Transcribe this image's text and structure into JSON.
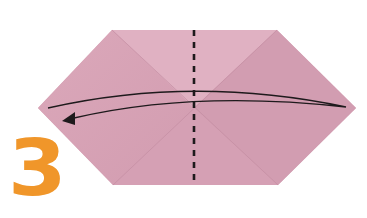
{
  "diagram": {
    "type": "origami-instruction-step",
    "step_number": "3",
    "colors": {
      "paper": "#d8a3b6",
      "paper_light": "#e2b4c4",
      "paper_shadow": "#c993a8",
      "crease": "#c08aa0",
      "fold_line": "#1e1a1c",
      "arrow": "#1e1a1c",
      "step_number": "#f0962a",
      "background": "#ffffff"
    },
    "paper_shape": {
      "kind": "hexagon",
      "vertices": [
        [
          112,
          30
        ],
        [
          277,
          30
        ],
        [
          356,
          108
        ],
        [
          278,
          185
        ],
        [
          113,
          185
        ],
        [
          38,
          108
        ]
      ]
    },
    "valley_fold_line": {
      "orientation": "vertical",
      "x": 194,
      "y_start": 30,
      "y_end": 185,
      "style": "dashed"
    },
    "fold_arrow": {
      "direction": "right-to-left",
      "meaning": "fold right half over to the left along dashed line"
    }
  }
}
